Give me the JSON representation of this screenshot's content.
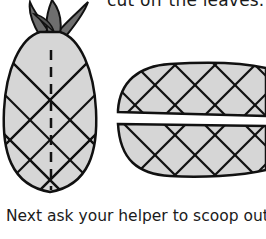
{
  "instructions": {
    "previous_step_tail": "cut off the leaves.",
    "next_step_start": "Next ask your helper to scoop out t"
  },
  "illustrations": [
    {
      "name": "whole-pineapple",
      "description": "Whole pineapple with leaves and dashed cut line"
    },
    {
      "name": "pineapple-halves",
      "description": "Pineapple cut lengthwise into two halves"
    }
  ],
  "colors": {
    "flesh": "#d6d6d6",
    "leaves": "#6e6e6e",
    "outline": "#111111"
  }
}
